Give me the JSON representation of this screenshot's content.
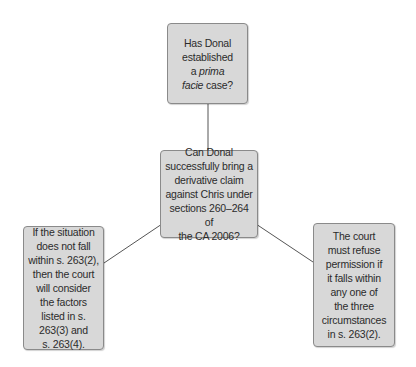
{
  "diagram": {
    "type": "mind-map",
    "colors": {
      "box_fill": "#d8d8d8",
      "box_border": "#8a8a8a",
      "line": "#555555",
      "text": "#2b2b2b"
    },
    "nodes": {
      "top": {
        "line1": "Has Donal",
        "line2": "established",
        "line3_prefix": "a ",
        "line3_italic": "prima",
        "line4_italic": "facie",
        "line4_suffix": " case?"
      },
      "center": {
        "lines": [
          "Can Donal",
          "successfully bring a",
          "derivative claim",
          "against Chris under",
          "sections 260–264 of",
          "the CA 2006?"
        ]
      },
      "left": {
        "lines": [
          "If the situation",
          "does not fall",
          "within s. 263(2),",
          "then the court",
          "will consider",
          "the factors",
          "listed in s.",
          "263(3) and",
          "s. 263(4)."
        ]
      },
      "right": {
        "lines": [
          "The court",
          "must refuse",
          "permission if",
          "it falls within",
          "any one of",
          "the three",
          "circumstances",
          "in s. 263(2)."
        ]
      }
    },
    "edges": [
      {
        "from": "center",
        "to": "top"
      },
      {
        "from": "center",
        "to": "left"
      },
      {
        "from": "center",
        "to": "right"
      }
    ]
  }
}
